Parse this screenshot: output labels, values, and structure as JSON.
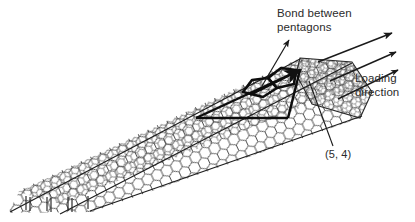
{
  "figure": {
    "background_color": "#ffffff",
    "line_color": "#1a1a1a",
    "text_color": "#2b2b2b"
  },
  "annotations": {
    "bond_between_pentagons": "Bond between\npentagons",
    "loading_direction": "Loading\ndirection",
    "chirality": "(5, 4)"
  },
  "structure": {
    "nanotube_label": "single-walled carbon nanotube",
    "lattice": "hexagonal",
    "defect": "pentagon-pentagon pair",
    "chiral_indices": [
      5,
      4
    ],
    "arrow_count": 3
  }
}
